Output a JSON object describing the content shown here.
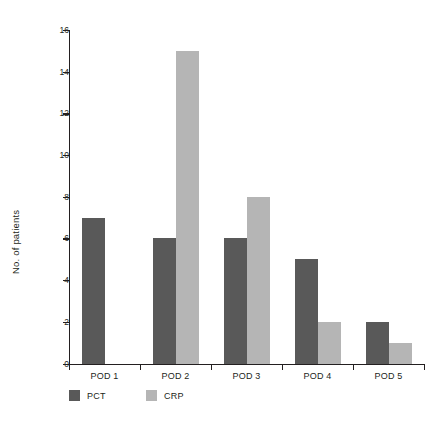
{
  "chart_data": {
    "type": "bar",
    "title": "",
    "xlabel": "",
    "ylabel": "No. of patients",
    "categories": [
      "POD 1",
      "POD 2",
      "POD 3",
      "POD 4",
      "POD 5"
    ],
    "series": [
      {
        "name": "PCT",
        "color": "#595959",
        "values": [
          7,
          6,
          6,
          5,
          2
        ]
      },
      {
        "name": "CRP",
        "color": "#b5b5b5",
        "values": [
          0,
          15,
          8,
          2,
          1
        ]
      }
    ],
    "ylim": [
      0,
      16
    ],
    "yticks": [
      0,
      2,
      4,
      6,
      8,
      10,
      12,
      14,
      16
    ],
    "ytick_labels": [
      "0",
      "2",
      "4",
      "6",
      "8",
      "10",
      "12",
      "14",
      "16"
    ],
    "grid": false,
    "legend_position": "bottom-left",
    "legend_entries": [
      "PCT",
      "CRP"
    ]
  },
  "axes": {
    "y_title": "No. of patients"
  }
}
